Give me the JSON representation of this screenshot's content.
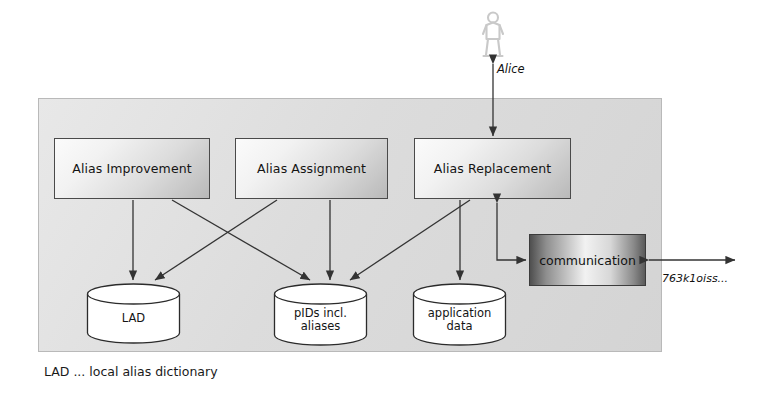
{
  "diagram": {
    "system_boundary_label": "",
    "processes": [
      {
        "id": "alias-improvement",
        "label": "Alias Improvement"
      },
      {
        "id": "alias-assignment",
        "label": "Alias Assignment"
      },
      {
        "id": "alias-replacement",
        "label": "Alias Replacement"
      }
    ],
    "communication": {
      "label": "communication"
    },
    "datastores": [
      {
        "id": "lad",
        "label_line1": "LAD",
        "label_line2": ""
      },
      {
        "id": "pids",
        "label_line1": "pIDs incl.",
        "label_line2": "aliases"
      },
      {
        "id": "application-data",
        "label_line1": "application",
        "label_line2": "data"
      }
    ],
    "actor": {
      "icon": "person-icon",
      "label": "Alice"
    },
    "external_channel": {
      "label": "763k1oiss..."
    },
    "legend": "LAD ... local alias dictionary",
    "colors": {
      "panel_fill": "#dcdcdc",
      "panel_stroke": "#b9b9b9",
      "box_stroke": "#4a4a4a",
      "arrow_stroke": "#333333",
      "cylinder_fill": "#ffffff",
      "cylinder_stroke": "#2b2b2b",
      "text": "#141414",
      "actor_fill": "#d9d9d9"
    },
    "edges": [
      {
        "from": "alias-improvement",
        "to": "lad",
        "kind": "arrow"
      },
      {
        "from": "alias-improvement",
        "to": "pids",
        "kind": "arrow"
      },
      {
        "from": "alias-assignment",
        "to": "lad",
        "kind": "arrow"
      },
      {
        "from": "alias-assignment",
        "to": "pids",
        "kind": "arrow"
      },
      {
        "from": "alias-replacement",
        "to": "pids",
        "kind": "arrow"
      },
      {
        "from": "alias-replacement",
        "to": "application-data",
        "kind": "arrow"
      },
      {
        "from": "alias-replacement",
        "to": "actor",
        "kind": "bidirectional"
      },
      {
        "from": "alias-replacement",
        "to": "communication",
        "kind": "bidirectional"
      },
      {
        "from": "communication",
        "to": "external",
        "kind": "bidirectional"
      }
    ]
  }
}
